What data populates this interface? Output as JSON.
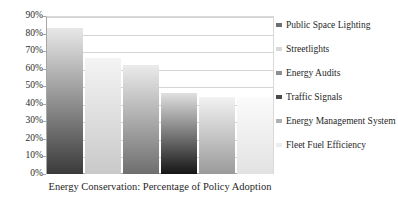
{
  "chart_data": {
    "type": "bar",
    "title": "",
    "subtitle": "",
    "xlabel": "Energy Conservation: Percentage of Policy Adoption",
    "ylabel": "",
    "categories": [
      "Public Space Lighting",
      "Streetlights",
      "Energy Audits",
      "Traffic Signals",
      "Energy Management System",
      "Fleet Fuel Efficiency"
    ],
    "values": [
      83,
      66,
      62,
      46,
      44,
      44
    ],
    "value_labels": [
      "83%",
      "66%",
      "62%",
      "46%",
      "44%",
      "44%"
    ],
    "ylim": [
      0,
      90
    ],
    "ytick_labels": [
      "0%",
      "10%",
      "20%",
      "30%",
      "40%",
      "50%",
      "60%",
      "70%",
      "80%",
      "90%"
    ],
    "ytick_values": [
      0,
      10,
      20,
      30,
      40,
      50,
      60,
      70,
      80,
      90
    ],
    "xtick_labels": [],
    "grid": true,
    "grid_axis": "y",
    "legend_position": "right",
    "series": [
      {
        "name": "Public Space Lighting",
        "value": 83,
        "gradient_top": "#e8e8e8",
        "gradient_bottom": "#3a3a3a",
        "swatch": "#6f6f6f"
      },
      {
        "name": "Streetlights",
        "value": 66,
        "gradient_top": "#f4f4f4",
        "gradient_bottom": "#c9c9c9",
        "swatch": "#d8d8d8"
      },
      {
        "name": "Energy Audits",
        "value": 62,
        "gradient_top": "#ebebeb",
        "gradient_bottom": "#6e6e6e",
        "swatch": "#8f8f8f"
      },
      {
        "name": "Traffic Signals",
        "value": 46,
        "gradient_top": "#e0e0e0",
        "gradient_bottom": "#151515",
        "swatch": "#4a4a4a"
      },
      {
        "name": "Energy Management System",
        "value": 44,
        "gradient_top": "#f2f2f2",
        "gradient_bottom": "#9a9a9a",
        "swatch": "#b0b0b0"
      },
      {
        "name": "Fleet Fuel Efficiency",
        "value": 44,
        "gradient_top": "#fbfbfb",
        "gradient_bottom": "#e2e2e2",
        "swatch": "#ededed"
      }
    ]
  },
  "legend": {
    "items": [
      {
        "label": "Public Space Lighting"
      },
      {
        "label": "Streetlights"
      },
      {
        "label": "Energy Audits"
      },
      {
        "label": "Traffic Signals"
      },
      {
        "label": "Energy Management System"
      },
      {
        "label": "Fleet Fuel Efficiency"
      }
    ]
  },
  "axis": {
    "x_title": "Energy Conservation: Percentage of Policy Adoption"
  },
  "colors": {
    "gridline": "#d4d4d4",
    "axis_line": "#a6a6a6",
    "text": "#1f1f1f",
    "background": "#ffffff"
  }
}
